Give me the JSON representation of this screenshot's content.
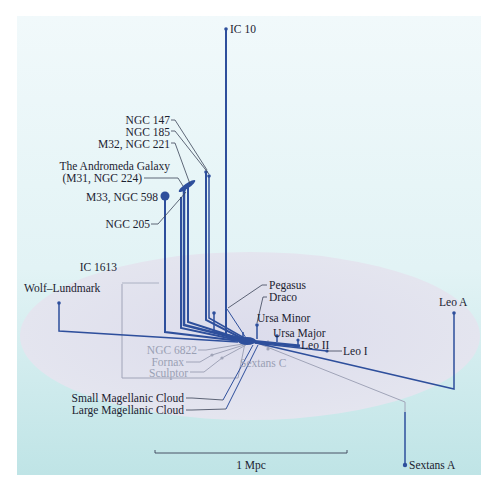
{
  "diagram": {
    "colors": {
      "panel_bg_top": "#eef8fa",
      "panel_bg_bottom": "#c3e6e8",
      "plane_fill": "#d9d9ea",
      "galaxy_line": "#2e4f9c",
      "galaxy_line_below": "#a0a4b8",
      "label_text": "#1b2230",
      "label_text_below": "#9aa0b4"
    },
    "labels_above": {
      "ic10": "IC 10",
      "ngc147": "NGC 147",
      "ngc185": "NGC 185",
      "m32": "M32, NGC 221",
      "andromeda_1": "The Andromeda Galaxy",
      "andromeda_2": "(M31, NGC 224)",
      "m33": "M33, NGC 598",
      "ngc205": "NGC 205",
      "ic1613": "IC 1613",
      "wolf_lundmark": "Wolf–Lundmark",
      "pegasus": "Pegasus",
      "draco": "Draco",
      "ursa_minor": "Ursa Minor",
      "ursa_major": "Ursa Major",
      "leo_ii": "Leo II",
      "leo_i": "Leo I",
      "leo_a": "Leo A",
      "small_magellanic": "Small Magellanic Cloud",
      "large_magellanic": "Large Magellanic Cloud",
      "sextans_a": "Sextans A"
    },
    "labels_below": {
      "ngc6822": "NGC 6822",
      "fornax": "Fornax",
      "sculptor": "Sculptor",
      "sextans_c": "Sextans C"
    },
    "scale_bar": {
      "label": "1 Mpc"
    }
  }
}
